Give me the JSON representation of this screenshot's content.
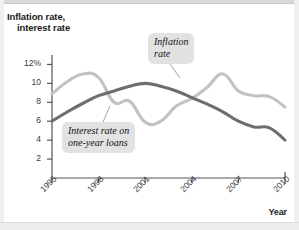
{
  "figure": {
    "y_axis_title_line1": "Inflation rate,",
    "y_axis_title_line2": "interest rate",
    "x_axis_title": "Year"
  },
  "callouts": {
    "inflation": {
      "line1": "Inflation",
      "line2": "rate"
    },
    "interest": {
      "line1": "Interest rate on",
      "line2": "one-year loans"
    }
  },
  "colors": {
    "inflation_line": "#c2c2c2",
    "interest_line": "#6e6e6e",
    "axis": "#555555",
    "callout_background": "#e2e2e2",
    "page_background": "#ffffff"
  },
  "chart_data": {
    "type": "line",
    "title": "",
    "xlabel": "Year",
    "ylabel": "Inflation rate, interest rate",
    "xlim": [
      1995,
      2010
    ],
    "ylim": [
      0,
      13
    ],
    "xticks": [
      1995,
      1998,
      2001,
      2004,
      2007,
      2010
    ],
    "xtick_labels": [
      "1995",
      "1998",
      "2001",
      "2004",
      "2007",
      "2010"
    ],
    "yticks": [
      2,
      4,
      6,
      8,
      10,
      12
    ],
    "ytick_labels": [
      "2",
      "4",
      "6",
      "8",
      "10",
      "12%"
    ],
    "grid": false,
    "legend": "inline-callouts",
    "x": [
      1995,
      1996,
      1997,
      1998,
      1999,
      2000,
      2001,
      2002,
      2003,
      2004,
      2005,
      2006,
      2007,
      2008,
      2009,
      2010
    ],
    "series": [
      {
        "name": "Inflation rate",
        "color": "#c2c2c2",
        "values": [
          8.9,
          10.2,
          11.0,
          10.6,
          8.0,
          8.1,
          5.9,
          6.0,
          7.6,
          8.4,
          9.6,
          11.0,
          9.2,
          8.7,
          8.6,
          7.5
        ]
      },
      {
        "name": "Interest rate on one-year loans",
        "color": "#6e6e6e",
        "values": [
          6.0,
          7.0,
          7.9,
          8.7,
          9.2,
          9.7,
          10.0,
          9.7,
          9.2,
          8.5,
          7.8,
          7.0,
          6.0,
          5.4,
          5.3,
          4.0
        ]
      }
    ]
  }
}
